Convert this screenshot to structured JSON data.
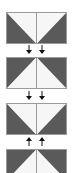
{
  "colors": {
    "dark": "#5a5a5a",
    "light": "#f6f6f6",
    "divider": "#9a9a9a",
    "arrow": "#111111"
  },
  "panels": [
    {
      "index": 1,
      "pattern": "v-light-top",
      "y": 12
    },
    {
      "index": 2,
      "pattern": "peak-light-bottom",
      "y": 57
    },
    {
      "index": 3,
      "pattern": "v-light-top",
      "y": 103
    },
    {
      "index": 4,
      "pattern": "peak-light-bottom",
      "y": 149
    }
  ],
  "connectors": [
    {
      "between": [
        1,
        2
      ],
      "direction": "down",
      "y": 45
    },
    {
      "between": [
        2,
        3
      ],
      "direction": "down",
      "y": 91
    },
    {
      "between": [
        3,
        4
      ],
      "direction": "up",
      "y": 137
    }
  ]
}
